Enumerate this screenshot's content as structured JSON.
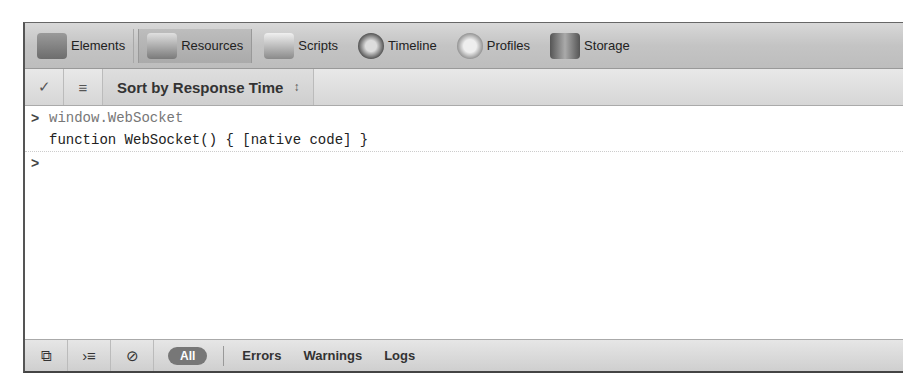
{
  "tabs": [
    {
      "label": "Elements",
      "icon": "elements-icon",
      "active": false
    },
    {
      "label": "Resources",
      "icon": "resources-icon",
      "active": true
    },
    {
      "label": "Scripts",
      "icon": "scripts-icon",
      "active": false
    },
    {
      "label": "Timeline",
      "icon": "timeline-icon",
      "active": false
    },
    {
      "label": "Profiles",
      "icon": "profiles-icon",
      "active": false
    },
    {
      "label": "Storage",
      "icon": "storage-icon",
      "active": false
    }
  ],
  "toolbar": {
    "sort_label": "Sort by Response Time",
    "sort_arrows": "↕"
  },
  "console": {
    "lines": [
      {
        "type": "command",
        "prompt": ">",
        "text": "window.WebSocket"
      },
      {
        "type": "result",
        "text": "function WebSocket() { [native code] }"
      },
      {
        "type": "input",
        "prompt": ">",
        "text": ""
      }
    ]
  },
  "statusbar": {
    "filters": {
      "all": "All",
      "errors": "Errors",
      "warnings": "Warnings",
      "logs": "Logs"
    }
  }
}
